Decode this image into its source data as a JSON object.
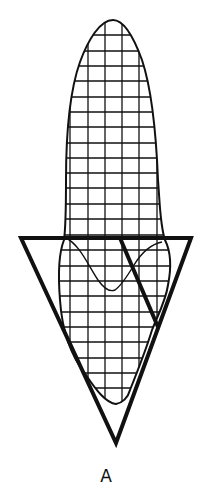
{
  "figure": {
    "label": "A",
    "colors": {
      "ink": "#111111",
      "background": "#ffffff"
    },
    "grid": {
      "x_lines": [
        53,
        70,
        88,
        105,
        122,
        139,
        157,
        174
      ],
      "y_lines": [
        35,
        51,
        66,
        81,
        97,
        112,
        127,
        143,
        158,
        173,
        188,
        204,
        219,
        235,
        250,
        266,
        281,
        296,
        312,
        327,
        342,
        358,
        373,
        388,
        404
      ]
    },
    "triangle": {
      "points": [
        [
          21,
          238
        ],
        [
          191,
          238
        ],
        [
          116,
          443
        ]
      ]
    },
    "diagonal": {
      "from": [
        120,
        238
      ],
      "to": [
        158,
        327
      ]
    }
  }
}
